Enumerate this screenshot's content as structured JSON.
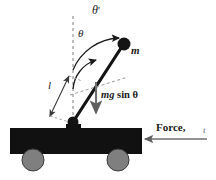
{
  "figure": {
    "width": 216,
    "height": 180,
    "background": "#ffffff"
  },
  "labels": {
    "theta_prime": "θ",
    "theta_prime_mark": "'",
    "theta": "θ",
    "mass": "m",
    "length": "l",
    "gravity_component_mg": "mg",
    "gravity_component_sin": " sin ",
    "gravity_component_theta": "θ",
    "force": "Force,",
    "force_variable": "t"
  },
  "colors": {
    "cart_body": "#111111",
    "wheel": "#7f7f7f",
    "wheel_stroke": "#3a3a3a",
    "rod": "#141414",
    "bob": "#141414",
    "pivot": "#141414",
    "dashed_line": "#8c8c8c",
    "arc_arrow": "#1a1a1a",
    "force_arrow": "#6e6e6e",
    "mg_arrow": "#6e6e6e",
    "text": "#1a1a1a"
  },
  "geometry": {
    "pivot": {
      "x": 73,
      "y": 122
    },
    "bob": {
      "x": 124,
      "y": 44
    },
    "bob_radius": 6.5,
    "pivot_radius": 5.5,
    "vertical_dash_top": {
      "x": 73,
      "y": 16
    },
    "cart": {
      "x": 10,
      "y": 128,
      "width": 132,
      "height": 26
    },
    "wheels": [
      {
        "cx": 33,
        "cy": 160,
        "r": 11
      },
      {
        "cx": 118,
        "cy": 160,
        "r": 11
      }
    ],
    "force_arrow": {
      "x1": 206,
      "y1": 139,
      "x2": 144,
      "y2": 139
    },
    "mg_arrow": {
      "x1": 96,
      "y1": 81,
      "x2": 96,
      "y2": 114
    },
    "length_arrow": {
      "x1": 50,
      "y1": 115,
      "x2": 68,
      "y2": 76
    },
    "arc_theta_prime": {
      "radius": 52,
      "label_angle": "top"
    },
    "arc_theta": {
      "radius": 33,
      "label_angle": "mid"
    }
  }
}
